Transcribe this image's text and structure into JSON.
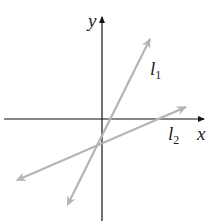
{
  "diagram": {
    "axes": {
      "x_label": "x",
      "y_label": "y"
    },
    "lines": [
      {
        "name": "l",
        "subscript": "1",
        "color": "#b5b5b5"
      },
      {
        "name": "l",
        "subscript": "2",
        "color": "#b5b5b5"
      }
    ],
    "axis_color": "#111111"
  }
}
